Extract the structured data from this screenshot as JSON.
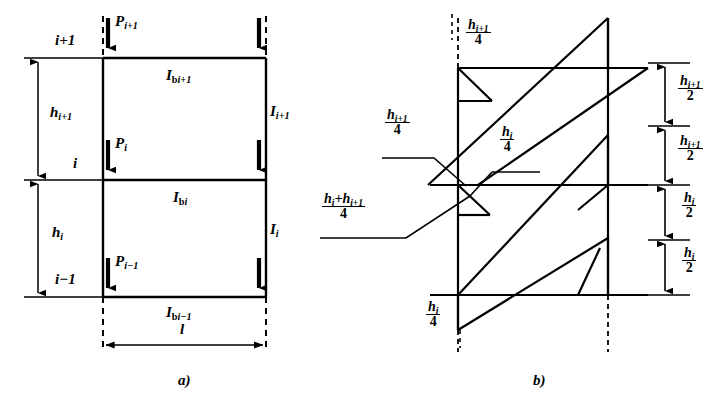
{
  "figure": {
    "type": "structural-engineering-diagram",
    "captions": {
      "a": "a)",
      "b": "b)"
    }
  },
  "part_a": {
    "caption": "a)",
    "storey_labels": [
      {
        "id": "level-i-plus-1",
        "text": "i+1"
      },
      {
        "id": "level-i",
        "text": "i"
      },
      {
        "id": "level-i-minus-1",
        "text": "i−1"
      }
    ],
    "storey_heights": [
      {
        "id": "h-i-plus-1",
        "text": "h",
        "sub": "i+1"
      },
      {
        "id": "h-i",
        "text": "h",
        "sub": "i"
      }
    ],
    "loads": [
      {
        "id": "load-p-i-plus-1",
        "symbol": "P",
        "sub": "i+1"
      },
      {
        "id": "load-p-i",
        "symbol": "P",
        "sub": "i"
      },
      {
        "id": "load-p-i-minus-1",
        "symbol": "P",
        "sub": "i−1"
      }
    ],
    "beam_inertias": [
      {
        "id": "beam-inertia-i-plus-1",
        "symbol": "I",
        "subscript_roman": "b",
        "subscript_italic": "i+1"
      },
      {
        "id": "beam-inertia-i",
        "symbol": "I",
        "subscript_roman": "b",
        "subscript_italic": "i"
      },
      {
        "id": "beam-inertia-i-minus-1",
        "symbol": "I",
        "subscript_roman": "b",
        "subscript_italic": "i−1"
      }
    ],
    "column_inertias": [
      {
        "id": "column-inertia-i-plus-1",
        "symbol": "I",
        "sub": "i+1"
      },
      {
        "id": "column-inertia-i",
        "symbol": "I",
        "sub": "i"
      }
    ],
    "span": {
      "id": "span-length",
      "symbol": "l"
    }
  },
  "part_b": {
    "caption": "b)",
    "left_annotations": [
      {
        "id": "frac-h-i-plus-1-over-4-top",
        "numerator": "h",
        "numerator_sub": "i+1",
        "denominator": "4"
      },
      {
        "id": "frac-h-i-plus-1-over-4-mid",
        "numerator": "h",
        "numerator_sub": "i+1",
        "denominator": "4"
      },
      {
        "id": "frac-h-i-over-4-mid",
        "numerator": "h",
        "numerator_sub": "i",
        "denominator": "4"
      },
      {
        "id": "frac-h-sum-over-4",
        "numerator": "h",
        "numerator_sub": "i",
        "numerator_plus": "+h",
        "numerator_sub2": "i+1",
        "denominator": "4"
      },
      {
        "id": "frac-h-i-over-4-bottom",
        "numerator": "h",
        "numerator_sub": "i",
        "denominator": "4"
      }
    ],
    "right_dimensions": [
      {
        "id": "dim-h-i-plus-1-over-2-upper",
        "numerator": "h",
        "numerator_sub": "i+1",
        "denominator": "2"
      },
      {
        "id": "dim-h-i-plus-1-over-2-lower",
        "numerator": "h",
        "numerator_sub": "i+1",
        "denominator": "2"
      },
      {
        "id": "dim-h-i-over-2-upper",
        "numerator": "h",
        "numerator_sub": "i",
        "denominator": "2"
      },
      {
        "id": "dim-h-i-over-2-lower",
        "numerator": "h",
        "numerator_sub": "i",
        "denominator": "2"
      }
    ]
  },
  "style": {
    "line_color": "#000000",
    "background": "#ffffff"
  }
}
